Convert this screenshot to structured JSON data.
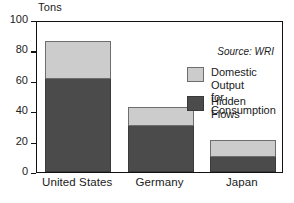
{
  "chart_data": {
    "type": "bar",
    "subtype": "stacked-bar",
    "title": "",
    "subtitle": "",
    "xlabel": "",
    "ylabel": "Tons",
    "ylim": [
      0,
      100
    ],
    "yticks": [
      0,
      20,
      40,
      60,
      80,
      100
    ],
    "grid": false,
    "legend_position": "inside-upper-right",
    "categories": [
      "United States",
      "Germany",
      "Japan"
    ],
    "series": [
      {
        "name": "Hidden Flows",
        "color": "#4b4b4b",
        "values": [
          61,
          30,
          10
        ]
      },
      {
        "name": "Domestic Output for Consumption",
        "color": "#cccccc",
        "values": [
          25,
          13,
          11
        ]
      }
    ],
    "totals": [
      86,
      43,
      21
    ],
    "annotations": [
      {
        "name": "source",
        "text": "Source: WRI"
      }
    ]
  },
  "axis": {
    "unit_label": "Tons",
    "tick_labels": [
      "100",
      "80",
      "60",
      "40",
      "20",
      "0"
    ]
  },
  "legend": {
    "entries": [
      {
        "label": "Domestic Output\nfor Consumption",
        "swatch": "light-gray-swatch"
      },
      {
        "label": "Hidden Flows",
        "swatch": "dark-gray-swatch"
      }
    ]
  },
  "source": {
    "text": "Source: WRI"
  },
  "colors": {
    "hidden_flows": "#4b4b4b",
    "domestic_output": "#cccccc",
    "frame": "#111111",
    "background": "#ffffff"
  }
}
